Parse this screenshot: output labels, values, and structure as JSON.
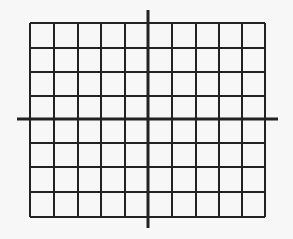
{
  "diagram": {
    "type": "coordinate-grid",
    "colors": {
      "background": "#f7f7f7",
      "line": "#222222"
    },
    "grid": {
      "columns": 10,
      "rows": 8,
      "columns_left_of_y_axis": 5,
      "columns_right_of_y_axis": 5,
      "rows_above_x_axis": 4,
      "rows_below_x_axis": 4,
      "vertical_lines_x": [
        30,
        54,
        78,
        101,
        125,
        148,
        172,
        196,
        219,
        242,
        265
      ],
      "horizontal_lines_y": [
        23,
        48,
        72,
        96,
        119,
        143,
        167,
        192,
        217
      ],
      "left": 30,
      "right": 265,
      "top": 23,
      "bottom": 217
    },
    "axes": {
      "x_axis": {
        "y": 119,
        "x_start": 17,
        "x_end": 278
      },
      "y_axis": {
        "x": 148,
        "y_start": 10,
        "y_end": 228
      }
    }
  }
}
